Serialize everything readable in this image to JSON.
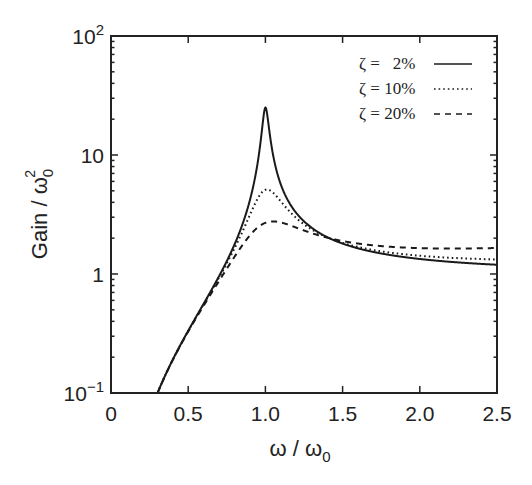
{
  "chart_data": {
    "type": "line",
    "title": "",
    "xlabel": "ω / ω0",
    "ylabel": "Gain / ω0²",
    "xlim": [
      0,
      2.5
    ],
    "ylim": [
      0.1,
      100
    ],
    "yscale": "log",
    "grid": false,
    "legend_position": "upper right",
    "x_ticks": [
      "0",
      "0.5",
      "1.0",
      "1.5",
      "2.0",
      "2.5"
    ],
    "y_ticks": [
      "10⁻¹",
      "1",
      "10",
      "10²"
    ],
    "x": [
      0.3,
      0.4,
      0.5,
      0.6,
      0.7,
      0.8,
      0.9,
      0.95,
      1.0,
      1.05,
      1.1,
      1.2,
      1.3,
      1.5,
      1.75,
      2.0,
      2.25,
      2.5
    ],
    "series": [
      {
        "name": "ζ = 2%",
        "zeta": 0.02,
        "line_style": "solid",
        "values": [
          0.099,
          0.19,
          0.333,
          0.563,
          0.961,
          1.78,
          4.26,
          8.65,
          25.0,
          9.96,
          5.76,
          3.27,
          2.45,
          1.8,
          1.49,
          1.33,
          1.25,
          1.19
        ]
      },
      {
        "name": "ζ = 10%",
        "zeta": 0.1,
        "line_style": "dotted",
        "values": [
          0.099,
          0.19,
          0.332,
          0.56,
          0.936,
          1.65,
          3.14,
          4.3,
          5.1,
          4.82,
          4.07,
          2.95,
          2.37,
          1.83,
          1.56,
          1.42,
          1.37,
          1.33
        ]
      },
      {
        "name": "ζ = 20%",
        "zeta": 0.2,
        "line_style": "dashed",
        "values": [
          0.099,
          0.188,
          0.329,
          0.54,
          0.875,
          1.4,
          2.11,
          2.45,
          2.69,
          2.74,
          2.71,
          2.45,
          2.2,
          1.89,
          1.74,
          1.65,
          1.64,
          1.65
        ]
      }
    ]
  },
  "axes": {
    "x_label_main": "ω / ω",
    "x_label_sub": "0",
    "y_label_main": "Gain / ω",
    "y_label_sub": "0",
    "y_label_sup": "2",
    "x_ticks": [
      {
        "value": 0,
        "label": "0"
      },
      {
        "value": 0.5,
        "label": "0.5"
      },
      {
        "value": 1.0,
        "label": "1.0"
      },
      {
        "value": 1.5,
        "label": "1.5"
      },
      {
        "value": 2.0,
        "label": "2.0"
      },
      {
        "value": 2.5,
        "label": "2.5"
      }
    ],
    "y_ticks": [
      {
        "exp": -1,
        "base": "10",
        "sup": "−1"
      },
      {
        "exp": 0,
        "base": "1",
        "sup": ""
      },
      {
        "exp": 1,
        "base": "10",
        "sup": ""
      },
      {
        "exp": 2,
        "base": "10",
        "sup": "2"
      }
    ]
  },
  "legend": {
    "items": [
      {
        "label": "ζ =   2%",
        "style": "solid"
      },
      {
        "label": "ζ = 10%",
        "style": "dotted"
      },
      {
        "label": "ζ = 20%",
        "style": "dashed"
      }
    ]
  },
  "colors": {
    "line": "#1a1a1a",
    "background": "#ffffff"
  }
}
